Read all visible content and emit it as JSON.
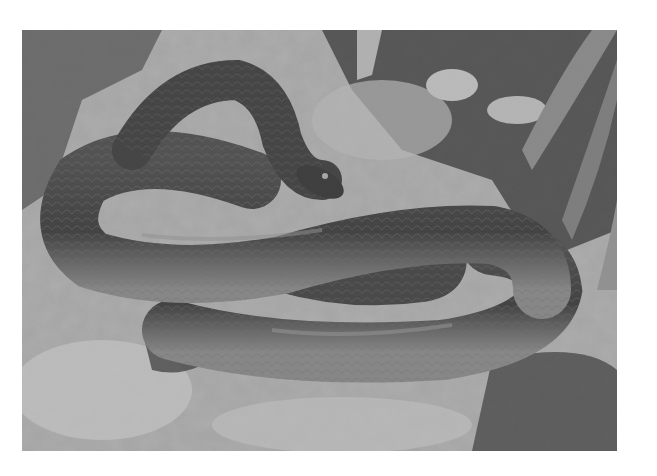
{
  "image": {
    "kind": "photograph",
    "mode": "grayscale",
    "subject": "coiled snake on rock",
    "alt": "Black-and-white photograph of a glossy, smooth-scaled snake coiled on pale, lichen-covered limestone rocks with long plant leaves at upper right",
    "frame": {
      "x": 22,
      "y": 30,
      "width": 595,
      "height": 421
    },
    "background_color": "#ffffff",
    "tones": {
      "rock_light": "#d9d9d9",
      "rock_mid": "#9a9a9a",
      "shadow": "#1e1e1e",
      "snake_body": "#2b2b2b",
      "snake_belly": "#a8a8a8",
      "leaf": "#8c8c8c"
    }
  }
}
